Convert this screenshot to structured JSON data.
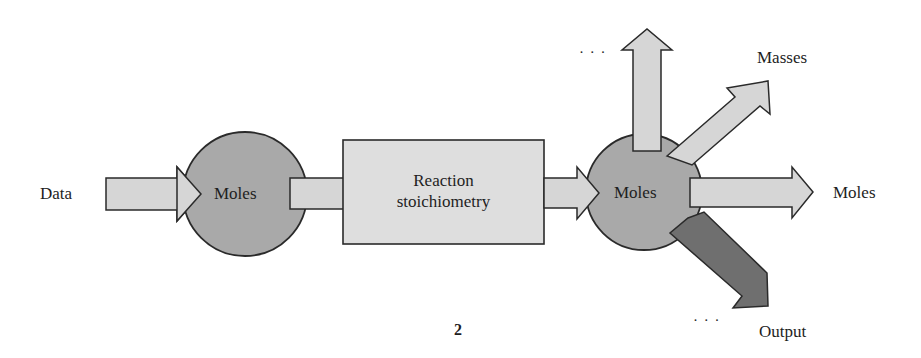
{
  "diagram": {
    "input_label": "Data",
    "first_node": "Moles",
    "process_box": [
      "Reaction",
      "stoichiometry"
    ],
    "second_node": "Moles",
    "outputs": {
      "up_ellipsis": "· · ·",
      "masses": "Masses",
      "moles": "Moles",
      "output": "Output",
      "down_ellipsis": "· · ·"
    },
    "page_number": "2"
  },
  "colors": {
    "arrow_light": "#d6d6d6",
    "circle": "#a9a9a9",
    "box": "#dedede",
    "output_arrow": "#6f6f6f",
    "stroke": "#2a2a2a"
  }
}
